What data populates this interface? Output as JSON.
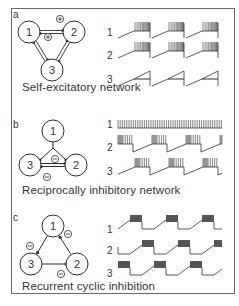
{
  "colors": {
    "ink": "#2f2f2f",
    "frame": "#6a6a6a",
    "text": "#333333",
    "burst_dense": "#555555"
  },
  "panels": [
    {
      "id": "a",
      "label": "a",
      "caption": "Self-excitatory network",
      "label_pos": [
        13,
        9
      ],
      "caption_pos": [
        22,
        80
      ],
      "neurons": [
        {
          "id": "1",
          "cx": 29,
          "cy": 32,
          "r": 11
        },
        {
          "id": "2",
          "cx": 74,
          "cy": 32,
          "r": 11
        },
        {
          "id": "3",
          "cx": 52,
          "cy": 70,
          "r": 11
        }
      ],
      "synapse_signs": [
        {
          "sign": "+",
          "x": 60,
          "y": 19
        },
        {
          "sign": "+",
          "x": 48,
          "y": 37
        }
      ],
      "connections": "double-lines-all-pairs",
      "traces": [
        {
          "label": "1",
          "y": 32,
          "pattern": "ramp-burst-reset",
          "period": 34,
          "bursts": 3
        },
        {
          "label": "2",
          "y": 52,
          "pattern": "ramp-burst-reset",
          "period": 34,
          "bursts": 3
        },
        {
          "label": "3",
          "y": 80,
          "pattern": "ramp-reset",
          "period": 34,
          "bursts": 3
        }
      ]
    },
    {
      "id": "b",
      "label": "b",
      "caption": "Reciprocally inhibitory network",
      "label_pos": [
        13,
        121
      ],
      "caption_pos": [
        22,
        184
      ],
      "neurons": [
        {
          "id": "1",
          "cx": 53,
          "cy": 131,
          "r": 11
        },
        {
          "id": "2",
          "cx": 76,
          "cy": 165,
          "r": 11
        },
        {
          "id": "3",
          "cx": 30,
          "cy": 165,
          "r": 11
        }
      ],
      "synapse_signs": [
        {
          "sign": "−",
          "x": 55,
          "y": 159
        },
        {
          "sign": "−",
          "x": 47,
          "y": 177
        }
      ],
      "connections": "triangle-inhibitory",
      "traces": [
        {
          "label": "1",
          "y": 124,
          "pattern": "tonic"
        },
        {
          "label": "2",
          "y": 145,
          "pattern": "burst-ramp-alternate",
          "phase": 0
        },
        {
          "label": "3",
          "y": 168,
          "pattern": "burst-ramp-alternate",
          "phase": 1
        }
      ]
    },
    {
      "id": "c",
      "label": "c",
      "caption": "Recurrent cyclic inhibition",
      "label_pos": [
        13,
        214
      ],
      "caption_pos": [
        22,
        282
      ],
      "neurons": [
        {
          "id": "1",
          "cx": 53,
          "cy": 226,
          "r": 11
        },
        {
          "id": "2",
          "cx": 77,
          "cy": 264,
          "r": 11
        },
        {
          "id": "3",
          "cx": 31,
          "cy": 264,
          "r": 11
        }
      ],
      "synapse_signs": [
        {
          "sign": "−",
          "x": 68,
          "y": 234
        },
        {
          "sign": "−",
          "x": 30,
          "y": 246
        },
        {
          "sign": "−",
          "x": 61,
          "y": 274
        }
      ],
      "connections": "cyclic",
      "traces": [
        {
          "label": "1",
          "y": 224,
          "pattern": "cyclic",
          "phase": 0
        },
        {
          "label": "2",
          "y": 249,
          "pattern": "cyclic",
          "phase": 1
        },
        {
          "label": "3",
          "y": 270,
          "pattern": "cyclic",
          "phase": 2
        }
      ]
    }
  ]
}
